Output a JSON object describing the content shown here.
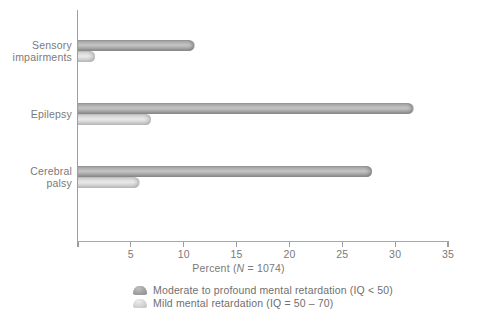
{
  "chart_data": {
    "type": "bar",
    "orientation": "horizontal",
    "title": "",
    "xlabel": "Percent (N = 1074)",
    "ylabel": "",
    "xlim": [
      0,
      35
    ],
    "xticks": [
      0,
      5,
      10,
      15,
      20,
      25,
      30,
      35
    ],
    "xtick_labels": [
      "",
      "5",
      "10",
      "15",
      "20",
      "25",
      "30",
      "35"
    ],
    "grid": false,
    "legend_position": "bottom-center",
    "categories": [
      "Sensory impairments",
      "Epilepsy",
      "Cerebral palsy"
    ],
    "series": [
      {
        "name": "Moderate to profound mental retardation (IQ < 50)",
        "color": "#a8a8a8",
        "values": [
          11.0,
          31.7,
          27.8
        ]
      },
      {
        "name": "Mild mental retardation (IQ = 50 – 70)",
        "color": "#dcdcdc",
        "values": [
          1.6,
          6.9,
          5.8
        ]
      }
    ]
  },
  "axis": {
    "x_title_prefix": "Percent (",
    "x_title_italic": "N",
    "x_title_suffix": " = 1074)"
  },
  "categories": [
    {
      "id": "sensory",
      "label": "Sensory\nimpairments"
    },
    {
      "id": "epilepsy",
      "label": "Epilepsy"
    },
    {
      "id": "cerebral-palsy",
      "label": "Cerebral\npalsy"
    }
  ],
  "ticks": [
    {
      "value": 0,
      "label": ""
    },
    {
      "value": 5,
      "label": "5"
    },
    {
      "value": 10,
      "label": "10"
    },
    {
      "value": 15,
      "label": "15"
    },
    {
      "value": 20,
      "label": "20"
    },
    {
      "value": 25,
      "label": "25"
    },
    {
      "value": 30,
      "label": "30"
    },
    {
      "value": 35,
      "label": "35"
    }
  ],
  "legend": [
    {
      "id": "moderate-profound",
      "label": "Moderate to profound mental retardation (IQ < 50)",
      "tone": "dark"
    },
    {
      "id": "mild",
      "label": "Mild mental retardation (IQ = 50 – 70)",
      "tone": "light"
    }
  ],
  "colors": {
    "dark_bar": "#a8a8a8",
    "light_bar": "#dcdcdc",
    "axis": "#9a9a9a",
    "text": "#7a7a7a",
    "background": "#ffffff"
  }
}
